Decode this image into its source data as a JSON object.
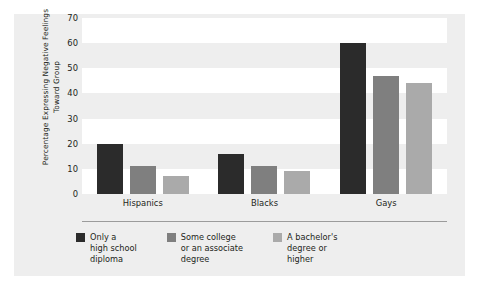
{
  "chart_data": {
    "type": "bar",
    "title": "",
    "subtitle": "",
    "xlabel": "",
    "ylabel": "Percentage Expressing Negative Feelings Toward Group",
    "categories": [
      "Hispanics",
      "Blacks",
      "Gays"
    ],
    "series": [
      {
        "name": "Only a high school diploma",
        "color": "#2b2b2b",
        "values": [
          20,
          16,
          60
        ]
      },
      {
        "name": "Some college or an associate degree",
        "color": "#7f7f7f",
        "values": [
          11,
          11,
          47
        ]
      },
      {
        "name": "A bachelor's degree or higher",
        "color": "#aaaaaa",
        "values": [
          7,
          9,
          44
        ]
      }
    ],
    "ylim": [
      0,
      70
    ],
    "yticks": [
      0,
      10,
      20,
      30,
      40,
      50,
      60,
      70
    ],
    "ytick_labels": [
      "0",
      "10",
      "20",
      "30",
      "40",
      "50",
      "60",
      "70"
    ],
    "grid": true,
    "grid_style": "alternating horizontal bands",
    "legend_position": "bottom-left",
    "legend_entries": [
      "Only a\nhigh school\ndiploma",
      "Some college\nor an associate\ndegree",
      "A bachelor's\ndegree or\nhigher"
    ],
    "background_color": "#eeeeee",
    "band_color": "#ffffff"
  }
}
